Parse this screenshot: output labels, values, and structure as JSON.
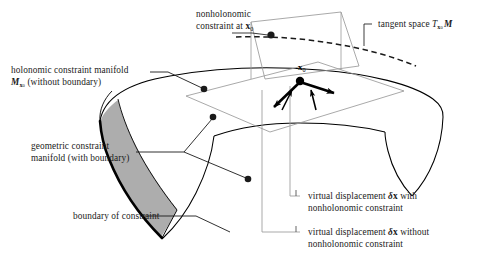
{
  "figure": {
    "title_alt": "Constraint manifolds and virtual displacements diagram",
    "colors": {
      "ink": "#1a1a1a",
      "surface_line": "#000000",
      "thin_line": "#8c8c8c",
      "shade_fill": "#a8a8a8",
      "background": "#ffffff",
      "arrow": "#000000"
    }
  },
  "labels": {
    "nonholonomic_constraint": {
      "line1": "nonholonomic",
      "line2_prefix": "constraint at ",
      "line2_var": "x",
      "line2_sub": "0"
    },
    "tangent_space": {
      "prefix": "tangent space ",
      "symbol": "T",
      "sub_var": "x",
      "sub_sub": "0",
      "manifold": "M"
    },
    "holonomic_manifold": {
      "line1": "holonomic constraint manifold",
      "line2_symbol": "M",
      "line2_sub": "x",
      "line2_subsub": "0",
      "line2_rest": " (without boundary)"
    },
    "geometric_manifold": {
      "line1": "geometric constraint",
      "line2": "manifold  (with boundary)"
    },
    "boundary_of_constraint": {
      "line1": "boundary of constraint"
    },
    "virtual_with": {
      "prefix": "virtual displacement ",
      "delta": "δ",
      "var": "x",
      "suffix": "  with",
      "line2": "nonholonomic constraint"
    },
    "virtual_without": {
      "prefix": "virtual displacement ",
      "delta": "δ",
      "var": "x",
      "suffix": "  without",
      "line2": "nonholonomic constraint"
    },
    "point_x0": {
      "var": "x",
      "sub": "0"
    }
  }
}
